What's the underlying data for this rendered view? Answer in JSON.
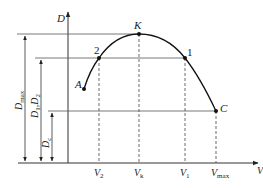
{
  "diagram": {
    "axes": {
      "y_label": "D",
      "x_label": "V"
    },
    "points": [
      {
        "id": "A",
        "label": "A"
      },
      {
        "id": "2",
        "label": "2"
      },
      {
        "id": "K",
        "label": "K"
      },
      {
        "id": "1",
        "label": "1"
      },
      {
        "id": "C",
        "label": "C"
      }
    ],
    "x_ticks": [
      {
        "main": "V",
        "sub": "2"
      },
      {
        "main": "V",
        "sub": "k"
      },
      {
        "main": "V",
        "sub": "1"
      },
      {
        "main": "V",
        "sub": "max"
      }
    ],
    "dimension_labels": [
      {
        "main": "D",
        "sub": "max"
      },
      {
        "main": "D",
        "sub1": "1",
        "sep": ",",
        "main2": "D",
        "sub2": "2"
      },
      {
        "main": "D",
        "sub": "c"
      }
    ]
  }
}
